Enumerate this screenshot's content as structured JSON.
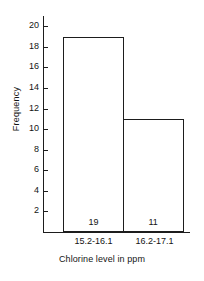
{
  "chart_data": {
    "type": "bar",
    "title": "",
    "subtitle": "",
    "xlabel": "Chlorine level in ppm",
    "ylabel": "Frequency",
    "categories": [
      "15.2-16.1",
      "16.2-17.1"
    ],
    "values": [
      19,
      11
    ],
    "value_labels": [
      "19",
      "11"
    ],
    "ylim": [
      0,
      21
    ],
    "ytick_labels": [
      "20",
      "18",
      "16",
      "14",
      "12",
      "10",
      "8",
      "6",
      "4",
      "2"
    ],
    "yticks": [
      20,
      18,
      16,
      14,
      12,
      10,
      8,
      6,
      4,
      2
    ],
    "grid": false,
    "legend": false,
    "legend_position": "none",
    "bars_adjacent": true,
    "bar_fill": "#ffffff",
    "bar_stroke": "#1d1d1d",
    "axis_color": "#1d1d1d",
    "background": "#ffffff"
  }
}
